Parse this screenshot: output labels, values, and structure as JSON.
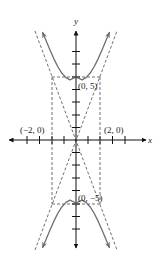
{
  "figure": {
    "axes": {
      "x_label": "x",
      "y_label": "y"
    },
    "points": {
      "upper_vertex": "(0, 5)",
      "lower_vertex": "(0, −5)",
      "left_covertex": "(−2, 0)",
      "right_covertex": "(2, 0)"
    },
    "colors": {
      "axes": "#111111",
      "curve": "#6e6e6e",
      "dashed": "#707070"
    }
  }
}
